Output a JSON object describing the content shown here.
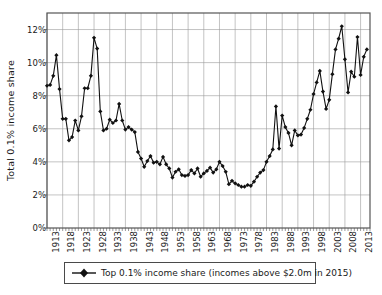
{
  "chart_data": {
    "type": "line",
    "title": "",
    "subtitle": "",
    "xlabel": "",
    "ylabel": "Total 0.1% income share",
    "xlim": [
      1913,
      2016
    ],
    "ylim": [
      0,
      13
    ],
    "grid": true,
    "legend_position": "bottom",
    "y_tick_labels": [
      "0%",
      "2%",
      "4%",
      "6%",
      "8%",
      "10%",
      "12%"
    ],
    "y_tick_values": [
      0,
      2,
      4,
      6,
      8,
      10,
      12
    ],
    "x_tick_labels": [
      "1913",
      "1918",
      "1923",
      "1928",
      "1933",
      "1938",
      "1943",
      "1948",
      "1953",
      "1958",
      "1963",
      "1968",
      "1973",
      "1978",
      "1983",
      "1988",
      "1993",
      "1998",
      "2003",
      "2008",
      "2013"
    ],
    "x_tick_values": [
      1913,
      1918,
      1923,
      1928,
      1933,
      1938,
      1943,
      1948,
      1953,
      1958,
      1963,
      1968,
      1973,
      1978,
      1983,
      1988,
      1993,
      1998,
      2003,
      2008,
      2013
    ],
    "series": [
      {
        "name": "Top 0.1% income share (incomes above $2.0m in 2015)",
        "marker": "diamond",
        "color": "#111111",
        "x": [
          1913,
          1914,
          1915,
          1916,
          1917,
          1918,
          1919,
          1920,
          1921,
          1922,
          1923,
          1924,
          1925,
          1926,
          1927,
          1928,
          1929,
          1930,
          1931,
          1932,
          1933,
          1934,
          1935,
          1936,
          1937,
          1938,
          1939,
          1940,
          1941,
          1942,
          1943,
          1944,
          1945,
          1946,
          1947,
          1948,
          1949,
          1950,
          1951,
          1952,
          1953,
          1954,
          1955,
          1956,
          1957,
          1958,
          1959,
          1960,
          1961,
          1962,
          1963,
          1964,
          1965,
          1966,
          1967,
          1968,
          1969,
          1970,
          1971,
          1972,
          1973,
          1974,
          1975,
          1976,
          1977,
          1978,
          1979,
          1980,
          1981,
          1982,
          1983,
          1984,
          1985,
          1986,
          1987,
          1988,
          1989,
          1990,
          1991,
          1992,
          1993,
          1994,
          1995,
          1996,
          1997,
          1998,
          1999,
          2000,
          2001,
          2002,
          2003,
          2004,
          2005,
          2006,
          2007,
          2008,
          2009,
          2010,
          2011,
          2012,
          2013,
          2014,
          2015
        ],
        "values": [
          8.6,
          8.65,
          9.2,
          10.45,
          8.4,
          6.6,
          6.6,
          5.3,
          5.5,
          6.5,
          5.9,
          6.75,
          8.45,
          8.45,
          9.2,
          11.5,
          10.85,
          7.05,
          5.9,
          6.0,
          6.55,
          6.35,
          6.5,
          7.5,
          6.5,
          5.95,
          6.1,
          5.95,
          5.8,
          4.6,
          4.2,
          3.7,
          4.05,
          4.35,
          3.95,
          4.0,
          3.85,
          4.3,
          3.85,
          3.6,
          3.05,
          3.4,
          3.55,
          3.2,
          3.15,
          3.2,
          3.5,
          3.3,
          3.6,
          3.1,
          3.3,
          3.45,
          3.65,
          3.35,
          3.55,
          4.0,
          3.75,
          3.4,
          2.65,
          2.85,
          2.7,
          2.6,
          2.5,
          2.5,
          2.6,
          2.55,
          2.8,
          3.1,
          3.35,
          3.5,
          4.0,
          4.35,
          4.75,
          7.35,
          4.8,
          6.8,
          6.1,
          5.75,
          5.0,
          5.9,
          5.6,
          5.65,
          6.05,
          6.6,
          7.15,
          8.1,
          8.8,
          9.5,
          8.25,
          7.2,
          7.75,
          9.3,
          10.8,
          11.45,
          12.2,
          10.2,
          8.2,
          9.45,
          9.15,
          11.55,
          9.25,
          10.35,
          10.8
        ]
      }
    ]
  },
  "legend": {
    "entry_label": "Top 0.1% income share (incomes above $2.0m in 2015)"
  },
  "axis": {
    "y_title": "Total 0.1% income share"
  }
}
